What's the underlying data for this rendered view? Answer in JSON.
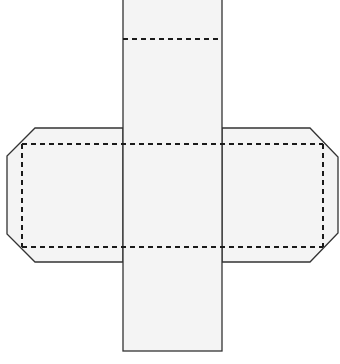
{
  "diagram": {
    "type": "net",
    "colors": {
      "fill": "#f4f4f4",
      "stroke": "#333333",
      "fold_line": "#1a1a1a",
      "background": "#ffffff"
    },
    "center_column": {
      "x": 123,
      "y": 0,
      "width": 99,
      "height": 351
    },
    "fold_lines": [
      {
        "name": "top-fold",
        "x1": 123,
        "y1": 39,
        "x2": 222,
        "y2": 39
      },
      {
        "name": "upper-fold",
        "x1": 22,
        "y1": 144,
        "x2": 323,
        "y2": 144
      },
      {
        "name": "lower-fold",
        "x1": 22,
        "y1": 247,
        "x2": 323,
        "y2": 247
      },
      {
        "name": "left-fold",
        "x1": 22,
        "y1": 144,
        "x2": 22,
        "y2": 247
      },
      {
        "name": "right-fold",
        "x1": 323,
        "y1": 144,
        "x2": 323,
        "y2": 247
      }
    ]
  }
}
